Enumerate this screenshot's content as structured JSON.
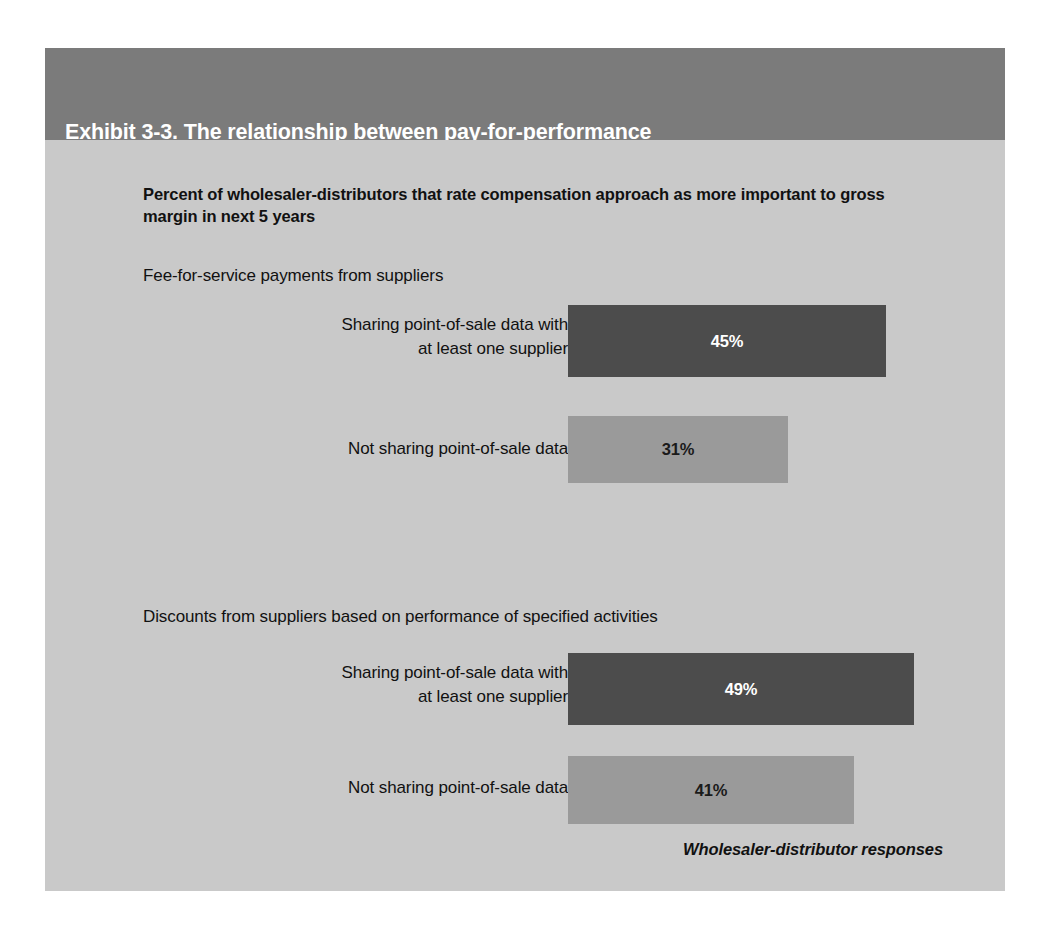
{
  "exhibit": {
    "title_line1": "Exhibit 3-3. The relationship between pay-for-performance",
    "title_line2": "and data sharing.",
    "subtitle": "Percent of wholesaler-distributors that rate compensation approach as more important to gross margin in next 5 years",
    "source_note": "Wholesaler-distributor responses",
    "colors": {
      "header_band": "#7b7b7b",
      "panel_background": "#c9c9c9",
      "bar_dark": "#4c4c4c",
      "bar_light": "#9a9a9a",
      "title_text": "#ffffff",
      "body_text": "#111111"
    }
  },
  "chart_data": {
    "type": "bar",
    "orientation": "horizontal",
    "title": "Exhibit 3-3. The relationship between pay-for-performance and data sharing.",
    "subtitle": "Percent of wholesaler-distributors that rate compensation approach as more important to gross margin in next 5 years",
    "xlabel": "",
    "ylabel": "",
    "xlim": [
      0,
      100
    ],
    "grid": false,
    "legend": "none",
    "value_suffix": "%",
    "annotation": "Wholesaler-distributor responses",
    "groups": [
      {
        "label": "Fee-for-service payments from suppliers",
        "categories": [
          "Sharing point-of-sale data with at least one supplier",
          "Not sharing point-of-sale data"
        ],
        "values": [
          45,
          31
        ],
        "value_labels": [
          "45%",
          "31%"
        ],
        "colors": [
          "#4c4c4c",
          "#9a9a9a"
        ]
      },
      {
        "label": "Discounts from suppliers based on performance of specified activities",
        "categories": [
          "Sharing point-of-sale data with at least one supplier",
          "Not sharing point-of-sale data"
        ],
        "values": [
          49,
          41
        ],
        "value_labels": [
          "49%",
          "41%"
        ],
        "colors": [
          "#4c4c4c",
          "#9a9a9a"
        ]
      }
    ]
  },
  "rows": [
    {
      "label_line1": "Sharing point-of-sale data with",
      "label_line2": "at least one supplier",
      "value_label": "45%"
    },
    {
      "label_line1": "Not sharing point-of-sale data",
      "label_line2": "",
      "value_label": "31%"
    },
    {
      "label_line1": "Sharing point-of-sale data with",
      "label_line2": "at least one supplier",
      "value_label": "49%"
    },
    {
      "label_line1": "Not sharing point-of-sale data",
      "label_line2": "",
      "value_label": "41%"
    }
  ]
}
